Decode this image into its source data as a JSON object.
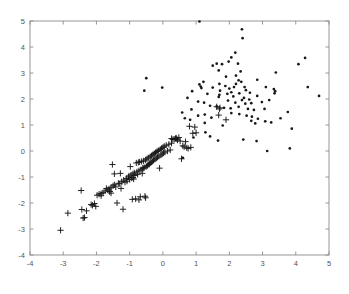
{
  "figure": {
    "title": "",
    "background_color": "#ffffff",
    "axis_color": "#8c8c8c",
    "marker_color": "#181818"
  },
  "chart_data": {
    "type": "scatter",
    "title": "",
    "xlabel": "",
    "ylabel": "",
    "xlim": [
      -4,
      5
    ],
    "ylim": [
      -4,
      5
    ],
    "grid": false,
    "legend": null,
    "xticks": [
      -4,
      -3,
      -2,
      -1,
      0,
      1,
      2,
      3,
      4,
      5
    ],
    "yticks": [
      -4,
      -3,
      -2,
      -1,
      0,
      1,
      2,
      3,
      4,
      5
    ],
    "xtick_labels": [
      "-4",
      "-3",
      "-2",
      "-1",
      "0",
      "1",
      "2",
      "3",
      "4",
      "5"
    ],
    "ytick_labels": [
      "-4",
      "-3",
      "-2",
      "-1",
      "0",
      "1",
      "2",
      "3",
      "4",
      "5"
    ],
    "series": [
      {
        "name": "class-plus",
        "marker": "plus",
        "color": "#181818",
        "points": [
          [
            -3.08,
            -3.05
          ],
          [
            -2.86,
            -2.39
          ],
          [
            -2.46,
            -1.52
          ],
          [
            -2.44,
            -2.25
          ],
          [
            -2.4,
            -2.58
          ],
          [
            -2.36,
            -2.56
          ],
          [
            -2.3,
            -2.3
          ],
          [
            -2.12,
            -2.09
          ],
          [
            -2.06,
            -2.02
          ],
          [
            -2.02,
            -2.13
          ],
          [
            -1.98,
            -1.7
          ],
          [
            -1.92,
            -1.66
          ],
          [
            -1.86,
            -1.64
          ],
          [
            -1.8,
            -1.6
          ],
          [
            -1.74,
            -1.54
          ],
          [
            -1.7,
            -1.44
          ],
          [
            -1.66,
            -1.5
          ],
          [
            -1.62,
            -1.46
          ],
          [
            -1.6,
            -1.56
          ],
          [
            -1.56,
            -1.4
          ],
          [
            -1.52,
            -0.52
          ],
          [
            -1.5,
            -1.34
          ],
          [
            -1.46,
            -1.3
          ],
          [
            -1.42,
            -1.38
          ],
          [
            -1.38,
            -2.0
          ],
          [
            -1.34,
            -1.24
          ],
          [
            -1.3,
            -1.26
          ],
          [
            -1.28,
            -0.86
          ],
          [
            -1.24,
            -1.18
          ],
          [
            -1.2,
            -2.24
          ],
          [
            -1.18,
            -1.12
          ],
          [
            -1.14,
            -1.2
          ],
          [
            -1.1,
            -1.06
          ],
          [
            -1.08,
            -1.16
          ],
          [
            -1.04,
            -1.0
          ],
          [
            -1.02,
            -0.96
          ],
          [
            -1.0,
            -1.1
          ],
          [
            -0.98,
            -0.6
          ],
          [
            -0.96,
            -0.92
          ],
          [
            -0.94,
            -1.04
          ],
          [
            -0.92,
            -1.86
          ],
          [
            -0.9,
            -0.88
          ],
          [
            -0.88,
            -1.08
          ],
          [
            -0.86,
            -0.84
          ],
          [
            -0.84,
            -0.94
          ],
          [
            -0.82,
            -1.84
          ],
          [
            -0.8,
            -0.46
          ],
          [
            -0.78,
            -0.8
          ],
          [
            -0.76,
            -0.9
          ],
          [
            -0.74,
            -0.44
          ],
          [
            -0.72,
            -0.76
          ],
          [
            -0.7,
            -0.42
          ],
          [
            -0.68,
            -1.76
          ],
          [
            -0.66,
            -0.72
          ],
          [
            -0.64,
            -0.4
          ],
          [
            -0.62,
            -0.86
          ],
          [
            -0.6,
            -0.68
          ],
          [
            -0.58,
            -0.38
          ],
          [
            -0.56,
            -0.64
          ],
          [
            -0.54,
            -1.74
          ],
          [
            -0.52,
            -0.34
          ],
          [
            -0.5,
            -0.6
          ],
          [
            -0.48,
            -0.3
          ],
          [
            -0.46,
            -0.56
          ],
          [
            -0.44,
            -0.26
          ],
          [
            -0.42,
            -0.52
          ],
          [
            -0.4,
            -0.48
          ],
          [
            -0.38,
            -0.22
          ],
          [
            -0.36,
            -0.44
          ],
          [
            -0.34,
            -0.18
          ],
          [
            -0.32,
            -0.4
          ],
          [
            -0.3,
            -0.14
          ],
          [
            -0.28,
            -0.36
          ],
          [
            -0.26,
            -0.1
          ],
          [
            -0.24,
            -0.32
          ],
          [
            -0.22,
            -0.06
          ],
          [
            -0.2,
            -0.28
          ],
          [
            -0.18,
            -0.02
          ],
          [
            -0.16,
            -0.24
          ],
          [
            -0.14,
            0.02
          ],
          [
            -0.12,
            -0.2
          ],
          [
            -0.1,
            -0.66
          ],
          [
            -0.08,
            0.06
          ],
          [
            -0.06,
            -0.16
          ],
          [
            -0.04,
            0.1
          ],
          [
            -0.02,
            -0.12
          ],
          [
            0.0,
            0.14
          ],
          [
            0.02,
            -0.08
          ],
          [
            0.04,
            0.18
          ],
          [
            0.06,
            -0.04
          ],
          [
            0.1,
            0.22
          ],
          [
            0.14,
            0.0
          ],
          [
            0.18,
            0.26
          ],
          [
            0.22,
            0.04
          ],
          [
            0.26,
            0.3
          ],
          [
            0.3,
            0.44
          ],
          [
            0.34,
            0.46
          ],
          [
            0.38,
            0.48
          ],
          [
            0.4,
            0.5
          ],
          [
            0.44,
            0.42
          ],
          [
            0.48,
            0.52
          ],
          [
            0.52,
            0.38
          ],
          [
            0.56,
            -0.3
          ],
          [
            0.6,
            0.2
          ],
          [
            0.64,
            0.16
          ],
          [
            0.68,
            0.36
          ],
          [
            0.72,
            0.12
          ],
          [
            0.76,
            0.1
          ],
          [
            0.8,
            0.95
          ],
          [
            0.84,
            0.14
          ],
          [
            0.9,
            0.68
          ],
          [
            0.96,
            0.92
          ],
          [
            1.0,
            0.7
          ],
          [
            -0.6,
            -0.65
          ],
          [
            -1.46,
            -0.88
          ],
          [
            -1.6,
            -1.55
          ],
          [
            -0.52,
            -1.8
          ],
          [
            -0.72,
            -1.88
          ],
          [
            1.62,
            1.7
          ],
          [
            1.68,
            1.38
          ],
          [
            1.72,
            1.66
          ],
          [
            1.9,
            1.2
          ],
          [
            1.7,
            1.62
          ],
          [
            0.26,
            0.48
          ],
          [
            0.42,
            0.46
          ],
          [
            -0.9,
            -1.02
          ],
          [
            -1.26,
            -1.44
          ],
          [
            -1.56,
            -1.62
          ],
          [
            -1.86,
            -1.72
          ],
          [
            -2.16,
            -2.06
          ]
        ]
      },
      {
        "name": "class-dot",
        "marker": "dot",
        "color": "#181818",
        "points": [
          [
            1.1,
            4.98
          ],
          [
            2.38,
            4.68
          ],
          [
            2.4,
            4.34
          ],
          [
            2.18,
            3.78
          ],
          [
            1.98,
            3.44
          ],
          [
            2.06,
            3.6
          ],
          [
            1.62,
            3.36
          ],
          [
            1.78,
            3.34
          ],
          [
            1.5,
            3.28
          ],
          [
            2.26,
            3.36
          ],
          [
            4.28,
            3.58
          ],
          [
            4.08,
            3.34
          ],
          [
            1.68,
            3.1
          ],
          [
            2.34,
            3.06
          ],
          [
            3.4,
            3.02
          ],
          [
            2.2,
            2.9
          ],
          [
            -0.5,
            2.8
          ],
          [
            1.9,
            2.86
          ],
          [
            2.28,
            2.72
          ],
          [
            2.84,
            2.74
          ],
          [
            1.22,
            2.66
          ],
          [
            1.1,
            2.56
          ],
          [
            1.7,
            2.58
          ],
          [
            1.14,
            2.48
          ],
          [
            1.16,
            2.42
          ],
          [
            -0.02,
            2.44
          ],
          [
            -0.56,
            2.32
          ],
          [
            1.72,
            2.32
          ],
          [
            2.0,
            2.4
          ],
          [
            2.46,
            2.46
          ],
          [
            2.5,
            2.34
          ],
          [
            3.34,
            2.38
          ],
          [
            3.38,
            2.3
          ],
          [
            3.36,
            2.22
          ],
          [
            4.36,
            2.46
          ],
          [
            4.7,
            2.12
          ],
          [
            0.88,
            2.3
          ],
          [
            1.7,
            2.16
          ],
          [
            1.68,
            2.08
          ],
          [
            2.06,
            2.26
          ],
          [
            2.12,
            2.1
          ],
          [
            2.3,
            2.22
          ],
          [
            2.62,
            2.24
          ],
          [
            2.84,
            2.12
          ],
          [
            3.1,
            2.46
          ],
          [
            0.74,
            2.04
          ],
          [
            1.24,
            1.86
          ],
          [
            1.96,
            1.94
          ],
          [
            2.18,
            1.86
          ],
          [
            2.38,
            1.96
          ],
          [
            2.48,
            1.82
          ],
          [
            2.66,
            1.84
          ],
          [
            1.06,
            1.9
          ],
          [
            1.42,
            1.74
          ],
          [
            1.62,
            1.72
          ],
          [
            1.84,
            1.66
          ],
          [
            2.04,
            1.64
          ],
          [
            2.28,
            1.7
          ],
          [
            2.56,
            1.62
          ],
          [
            2.74,
            1.58
          ],
          [
            3.06,
            1.62
          ],
          [
            3.76,
            1.5
          ],
          [
            0.58,
            1.48
          ],
          [
            1.26,
            1.4
          ],
          [
            2.06,
            1.46
          ],
          [
            2.3,
            1.42
          ],
          [
            2.52,
            1.36
          ],
          [
            2.68,
            1.32
          ],
          [
            2.86,
            1.24
          ],
          [
            3.08,
            1.14
          ],
          [
            3.54,
            1.26
          ],
          [
            0.82,
            1.2
          ],
          [
            0.66,
            1.26
          ],
          [
            1.46,
            1.28
          ],
          [
            2.66,
            1.16
          ],
          [
            2.78,
            1.06
          ],
          [
            3.26,
            1.1
          ],
          [
            3.88,
            0.86
          ],
          [
            1.8,
            0.98
          ],
          [
            1.28,
            0.72
          ],
          [
            1.66,
            0.4
          ],
          [
            2.42,
            0.44
          ],
          [
            2.82,
            0.38
          ],
          [
            1.42,
            0.56
          ],
          [
            3.14,
            0.0
          ],
          [
            3.82,
            0.1
          ],
          [
            0.6,
            -0.26
          ],
          [
            2.2,
            2.58
          ],
          [
            2.36,
            2.66
          ],
          [
            1.88,
            2.5
          ],
          [
            2.14,
            2.46
          ],
          [
            1.94,
            2.2
          ],
          [
            2.44,
            2.04
          ],
          [
            2.6,
            1.98
          ],
          [
            1.5,
            2.44
          ],
          [
            1.34,
            2.2
          ],
          [
            0.86,
            1.6
          ],
          [
            1.06,
            1.36
          ],
          [
            0.92,
            0.52
          ],
          [
            1.26,
            1.08
          ],
          [
            2.98,
            1.88
          ],
          [
            3.2,
            1.96
          ]
        ]
      }
    ]
  }
}
